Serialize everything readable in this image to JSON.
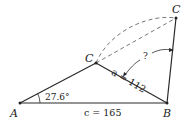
{
  "diagram": {
    "type": "ambiguous-case-triangle",
    "vertices": {
      "A": {
        "label": "A"
      },
      "B": {
        "label": "B"
      },
      "C1": {
        "label": "C"
      },
      "C2": {
        "label": "C"
      }
    },
    "angle_A": {
      "label": "27.6°"
    },
    "side_c": {
      "label": "c = 165"
    },
    "side_a_lower": {
      "label": "a = 112"
    },
    "side_a_upper": {
      "label": "a = 112"
    },
    "unknown_angle": {
      "label": "?"
    },
    "colors": {
      "stroke": "#2a2a2a",
      "text": "#222222"
    }
  }
}
